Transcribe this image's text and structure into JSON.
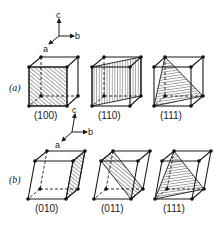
{
  "figure": {
    "row_a": {
      "label": "(a)",
      "axes": {
        "a": "a",
        "b": "b",
        "c": "c"
      },
      "planes": [
        {
          "miller": "(100)"
        },
        {
          "miller": "(110)"
        },
        {
          "miller": "(111)"
        }
      ]
    },
    "row_b": {
      "label": "(b)",
      "axes": {
        "a": "a",
        "b": "b",
        "c": "c"
      },
      "planes": [
        {
          "miller": "(010)"
        },
        {
          "miller": "(011)"
        },
        {
          "miller": "(111)"
        }
      ]
    },
    "colors": {
      "ink": "#1a1a1a",
      "background": "#ffffff"
    }
  }
}
